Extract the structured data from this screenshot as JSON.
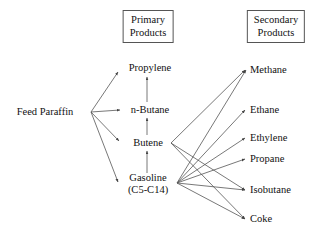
{
  "diagram": {
    "type": "flow-network",
    "stroke_color": "#555555",
    "text_color": "#111111",
    "background_color": "#ffffff",
    "headers": [
      {
        "id": "primary-header",
        "line1": "Primary",
        "line2": "Products",
        "x": 148,
        "y": 10
      },
      {
        "id": "secondary-header",
        "line1": "Secondary",
        "line2": "Products",
        "x": 276,
        "y": 10
      }
    ],
    "nodes": [
      {
        "id": "feed-paraffin",
        "label": "Feed Paraffin",
        "line2": "",
        "x": 45,
        "y": 112,
        "align": "center",
        "column": "feed"
      },
      {
        "id": "propylene",
        "label": "Propylene",
        "line2": "",
        "x": 150,
        "y": 68,
        "align": "center",
        "column": "primary"
      },
      {
        "id": "n-butane",
        "label": "n-Butane",
        "line2": "",
        "x": 150,
        "y": 110,
        "align": "center",
        "column": "primary"
      },
      {
        "id": "butene",
        "label": "Butene",
        "line2": "",
        "x": 148,
        "y": 143,
        "align": "center",
        "column": "primary"
      },
      {
        "id": "gasoline",
        "label": "Gasoline",
        "line2": "(C5-C14)",
        "x": 148,
        "y": 184,
        "align": "center",
        "column": "primary"
      },
      {
        "id": "methane",
        "label": "Methane",
        "line2": "",
        "x": 250,
        "y": 70,
        "align": "left",
        "column": "secondary"
      },
      {
        "id": "ethane",
        "label": "Ethane",
        "line2": "",
        "x": 250,
        "y": 110,
        "align": "left",
        "column": "secondary"
      },
      {
        "id": "ethylene",
        "label": "Ethylene",
        "line2": "",
        "x": 250,
        "y": 138,
        "align": "left",
        "column": "secondary"
      },
      {
        "id": "propane",
        "label": "Propane",
        "line2": "",
        "x": 250,
        "y": 159,
        "align": "left",
        "column": "secondary"
      },
      {
        "id": "isobutane",
        "label": "Isobutane",
        "line2": "",
        "x": 250,
        "y": 190,
        "align": "left",
        "column": "secondary"
      },
      {
        "id": "coke",
        "label": "Coke",
        "line2": "",
        "x": 250,
        "y": 219,
        "align": "left",
        "column": "secondary"
      }
    ],
    "edges": [
      {
        "from": "feed-paraffin",
        "to": "propylene",
        "x1": 91,
        "y1": 112,
        "x2": 118,
        "y2": 72
      },
      {
        "from": "feed-paraffin",
        "to": "n-butane",
        "x1": 91,
        "y1": 112,
        "x2": 120,
        "y2": 110
      },
      {
        "from": "feed-paraffin",
        "to": "butene",
        "x1": 91,
        "y1": 112,
        "x2": 119,
        "y2": 141
      },
      {
        "from": "feed-paraffin",
        "to": "gasoline",
        "x1": 91,
        "y1": 112,
        "x2": 118,
        "y2": 182
      },
      {
        "from": "n-butane",
        "to": "propylene",
        "x1": 147,
        "y1": 102,
        "x2": 147,
        "y2": 77
      },
      {
        "from": "butene",
        "to": "n-butane",
        "x1": 147,
        "y1": 135,
        "x2": 147,
        "y2": 118
      },
      {
        "from": "gasoline",
        "to": "butene",
        "x1": 147,
        "y1": 173,
        "x2": 147,
        "y2": 151
      },
      {
        "from": "butene",
        "to": "methane",
        "x1": 171,
        "y1": 143,
        "x2": 245,
        "y2": 70
      },
      {
        "from": "butene",
        "to": "isobutane",
        "x1": 171,
        "y1": 143,
        "x2": 245,
        "y2": 190
      },
      {
        "from": "butene",
        "to": "coke",
        "x1": 171,
        "y1": 143,
        "x2": 245,
        "y2": 219
      },
      {
        "from": "gasoline",
        "to": "methane",
        "x1": 177,
        "y1": 183,
        "x2": 246,
        "y2": 70
      },
      {
        "from": "gasoline",
        "to": "ethane",
        "x1": 177,
        "y1": 183,
        "x2": 245,
        "y2": 110
      },
      {
        "from": "gasoline",
        "to": "ethylene",
        "x1": 177,
        "y1": 183,
        "x2": 245,
        "y2": 138
      },
      {
        "from": "gasoline",
        "to": "propane",
        "x1": 177,
        "y1": 183,
        "x2": 245,
        "y2": 159
      },
      {
        "from": "gasoline",
        "to": "isobutane",
        "x1": 177,
        "y1": 183,
        "x2": 245,
        "y2": 190
      },
      {
        "from": "gasoline",
        "to": "coke",
        "x1": 177,
        "y1": 183,
        "x2": 245,
        "y2": 219
      }
    ]
  }
}
